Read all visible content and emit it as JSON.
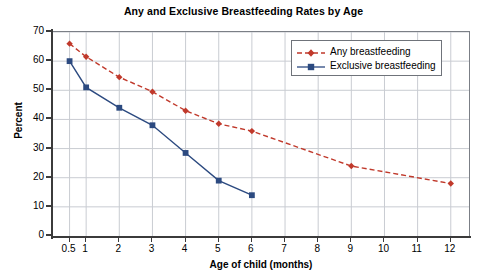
{
  "chart_data": {
    "type": "line",
    "title": "Any and Exclusive Breastfeeding Rates by Age",
    "xlabel": "Age of child (months)",
    "ylabel": "Percent",
    "x": [
      0.5,
      1,
      2,
      3,
      4,
      5,
      6,
      9,
      12
    ],
    "xtick_labels": [
      "0.5",
      "1",
      "2",
      "3",
      "4",
      "5",
      "6",
      "7",
      "8",
      "9",
      "10",
      "11",
      "12"
    ],
    "xtick_values": [
      0.5,
      1,
      2,
      3,
      4,
      5,
      6,
      7,
      8,
      9,
      10,
      11,
      12
    ],
    "ytick_labels": [
      "0",
      "10",
      "20",
      "30",
      "40",
      "50",
      "60",
      "70"
    ],
    "ytick_values": [
      0,
      10,
      20,
      30,
      40,
      50,
      60,
      70
    ],
    "xlim": [
      0,
      12.55
    ],
    "ylim": [
      0,
      70
    ],
    "grid": true,
    "grid_axes": "both",
    "legend_position": "top-right-inside",
    "series": [
      {
        "name": "Any breastfeeding",
        "color": "#c0392b",
        "line_style": "dashed",
        "marker": "diamond",
        "x": [
          0.5,
          1,
          2,
          3,
          4,
          5,
          6,
          9,
          12
        ],
        "values": [
          66,
          61.5,
          54.5,
          49.5,
          43,
          38.5,
          36,
          24,
          18
        ]
      },
      {
        "name": "Exclusive breastfeeding",
        "color": "#2c4a80",
        "line_style": "solid",
        "marker": "square",
        "x": [
          0.5,
          1,
          2,
          3,
          4,
          5,
          6
        ],
        "values": [
          60,
          51,
          44,
          38,
          28.5,
          19,
          14
        ]
      }
    ]
  },
  "legend": {
    "entries": [
      {
        "label": "Any breastfeeding"
      },
      {
        "label": "Exclusive breastfeeding"
      }
    ]
  },
  "colors": {
    "any_breastfeeding": "#c0392b",
    "exclusive_breastfeeding": "#2c4a80",
    "grid": "#c9ccd2",
    "axis": "#3b3b3b",
    "plot_border": "#7b7f86"
  }
}
